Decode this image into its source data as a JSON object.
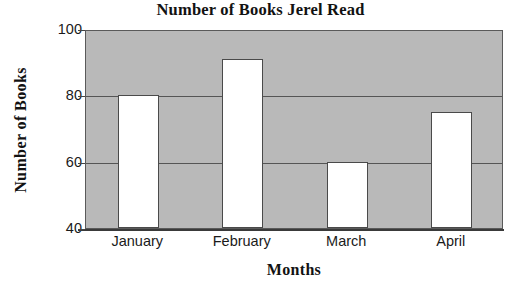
{
  "chart_data": {
    "type": "bar",
    "title": "Number of Books Jerel Read",
    "xlabel": "Months",
    "ylabel": "Number of Books",
    "categories": [
      "January",
      "February",
      "March",
      "April"
    ],
    "values": [
      80,
      91,
      60,
      75
    ],
    "ylim": [
      40,
      100
    ],
    "yticks": [
      40,
      60,
      80,
      100
    ],
    "ytick_labels": [
      "40",
      "60",
      "80",
      "100"
    ],
    "grid": true,
    "gridlines_at": [
      60,
      80
    ],
    "legend": null,
    "legend_position": "none",
    "series": [
      {
        "name": "Number of Books",
        "values": [
          80,
          91,
          60,
          75
        ]
      }
    ],
    "colors": {
      "plot_background": "#b9b9b9",
      "bar_fill": "#ffffff",
      "bar_outline": "#4a4a4a",
      "gridline": "#555555",
      "axis": "#3a3a3a",
      "text": "#121212",
      "page_background": "#ffffff"
    }
  }
}
